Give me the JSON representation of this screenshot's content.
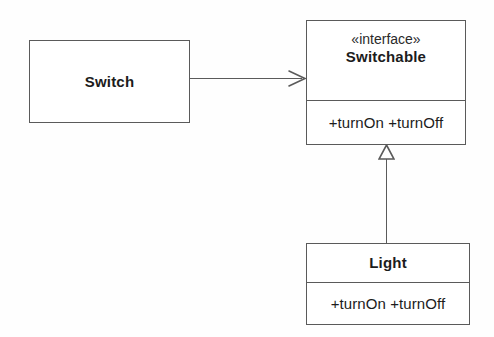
{
  "diagram": {
    "type": "uml-class-diagram",
    "line_color": "#5a5a5a",
    "text_color": "#1c1c1c",
    "background_color": "#ffffff",
    "classes": [
      {
        "id": "switch",
        "name": "Switch",
        "stereotype": "",
        "operations": "",
        "compartments": 1
      },
      {
        "id": "switchable",
        "name": "Switchable",
        "stereotype": "«interface»",
        "operations": "+turnOn +turnOff",
        "compartments": 2
      },
      {
        "id": "light",
        "name": "Light",
        "stereotype": "",
        "operations": "+turnOn +turnOff",
        "compartments": 2
      }
    ],
    "relationships": [
      {
        "id": "switch-uses-switchable",
        "from": "Switch",
        "to": "Switchable",
        "kind": "association",
        "arrowhead": "open-arrow",
        "direction": "left-to-right"
      },
      {
        "id": "light-implements-switchable",
        "from": "Light",
        "to": "Switchable",
        "kind": "realization",
        "arrowhead": "hollow-triangle",
        "direction": "bottom-to-top"
      }
    ]
  }
}
